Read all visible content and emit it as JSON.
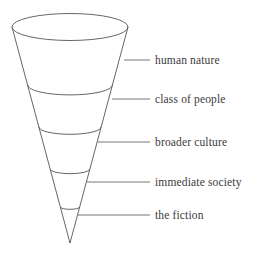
{
  "diagram": {
    "type": "inverted-cone-funnel",
    "title": "",
    "background_color": "#ffffff",
    "stroke_color": "#555555",
    "text_color": "#3a3a3a",
    "leader_line_color": "#666666",
    "cone": {
      "apex": {
        "x": 70,
        "y": 243
      },
      "top_center": {
        "x": 70,
        "y": 27
      },
      "top_radius_x": 58,
      "top_radius_y": 13.5
    },
    "segments": [
      {
        "index": 0,
        "label": "human nature",
        "divider_y": 85,
        "leader_y": 60,
        "leader_x_start": 124,
        "leader_x_end": 150,
        "label_x": 155,
        "label_y": 54
      },
      {
        "index": 1,
        "label": "class of people",
        "divider_y": 127,
        "leader_y": 99,
        "leader_x_start": 112,
        "leader_x_end": 150,
        "label_x": 155,
        "label_y": 93
      },
      {
        "index": 2,
        "label": "broader culture",
        "divider_y": 169,
        "leader_y": 142,
        "leader_x_start": 98,
        "leader_x_end": 150,
        "label_x": 155,
        "label_y": 136
      },
      {
        "index": 3,
        "label": "immediate society",
        "divider_y": 207,
        "leader_y": 182,
        "leader_x_start": 87,
        "leader_x_end": 150,
        "label_x": 155,
        "label_y": 176
      },
      {
        "index": 4,
        "label": "the fiction",
        "divider_y": null,
        "leader_y": 215,
        "leader_x_start": 78,
        "leader_x_end": 150,
        "label_x": 155,
        "label_y": 209
      }
    ]
  }
}
